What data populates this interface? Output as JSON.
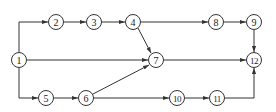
{
  "diagram": {
    "type": "network-activity-diagram",
    "nodes": [
      {
        "id": "1",
        "label": "1",
        "x": 19,
        "y": 60
      },
      {
        "id": "2",
        "label": "2",
        "x": 56,
        "y": 22
      },
      {
        "id": "3",
        "label": "3",
        "x": 94,
        "y": 22
      },
      {
        "id": "4",
        "label": "4",
        "x": 133,
        "y": 22
      },
      {
        "id": "5",
        "label": "5",
        "x": 46,
        "y": 98
      },
      {
        "id": "6",
        "label": "6",
        "x": 86,
        "y": 98
      },
      {
        "id": "7",
        "label": "7",
        "x": 156,
        "y": 60
      },
      {
        "id": "8",
        "label": "8",
        "x": 216,
        "y": 22
      },
      {
        "id": "9",
        "label": "9",
        "x": 254,
        "y": 22
      },
      {
        "id": "10",
        "label": "10",
        "x": 177,
        "y": 98
      },
      {
        "id": "11",
        "label": "11",
        "x": 217,
        "y": 98
      },
      {
        "id": "12",
        "label": "12",
        "x": 254,
        "y": 60
      }
    ],
    "edges": [
      {
        "from": "1",
        "to": "2",
        "path": [
          [
            19,
            52
          ],
          [
            19,
            22
          ],
          [
            48,
            22
          ]
        ]
      },
      {
        "from": "2",
        "to": "3",
        "path": [
          [
            64,
            22
          ],
          [
            86,
            22
          ]
        ]
      },
      {
        "from": "3",
        "to": "4",
        "path": [
          [
            102,
            22
          ],
          [
            125,
            22
          ]
        ]
      },
      {
        "from": "4",
        "to": "8",
        "path": [
          [
            141,
            22
          ],
          [
            208,
            22
          ]
        ]
      },
      {
        "from": "8",
        "to": "9",
        "path": [
          [
            224,
            22
          ],
          [
            246,
            22
          ]
        ]
      },
      {
        "from": "9",
        "to": "12",
        "path": [
          [
            254,
            30
          ],
          [
            254,
            52
          ]
        ]
      },
      {
        "from": "4",
        "to": "7",
        "path": [
          [
            138,
            28
          ],
          [
            151,
            53
          ]
        ]
      },
      {
        "from": "1",
        "to": "7",
        "path": [
          [
            27,
            60
          ],
          [
            148,
            60
          ]
        ]
      },
      {
        "from": "7",
        "to": "12",
        "path": [
          [
            164,
            60
          ],
          [
            246,
            60
          ]
        ]
      },
      {
        "from": "1",
        "to": "5",
        "path": [
          [
            19,
            68
          ],
          [
            19,
            98
          ],
          [
            38,
            98
          ]
        ]
      },
      {
        "from": "5",
        "to": "6",
        "path": [
          [
            54,
            98
          ],
          [
            78,
            98
          ]
        ]
      },
      {
        "from": "6",
        "to": "7",
        "path": [
          [
            93,
            94
          ],
          [
            149,
            65
          ]
        ]
      },
      {
        "from": "6",
        "to": "10",
        "path": [
          [
            94,
            98
          ],
          [
            169,
            98
          ]
        ]
      },
      {
        "from": "10",
        "to": "11",
        "path": [
          [
            185,
            98
          ],
          [
            209,
            98
          ]
        ]
      },
      {
        "from": "11",
        "to": "12",
        "path": [
          [
            225,
            98
          ],
          [
            254,
            98
          ],
          [
            254,
            68
          ]
        ]
      }
    ],
    "colors": {
      "stroke": "#333333",
      "background": "#ffffff",
      "text": "#222222"
    }
  }
}
